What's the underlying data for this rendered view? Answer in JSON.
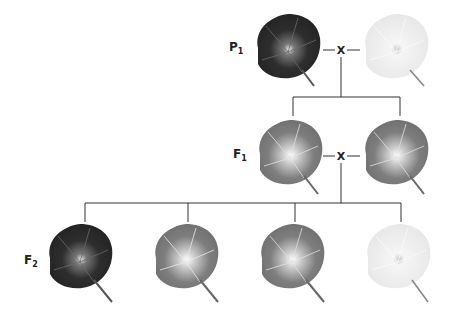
{
  "generations": [
    {
      "label": "P",
      "sub": "1",
      "cross_symbol": "X"
    },
    {
      "label": "F",
      "sub": "1",
      "cross_symbol": "X"
    },
    {
      "label": "F",
      "sub": "2"
    }
  ],
  "flowers": {
    "p1": [
      {
        "name": "purple-parent",
        "color": "#2a2a2a",
        "vein": "#6a6a6a"
      },
      {
        "name": "white-parent",
        "color": "#ececec",
        "vein": "#ffffff"
      }
    ],
    "f1": [
      {
        "name": "f1-offspring-1",
        "color": "#7a7a7a",
        "vein": "#d8d8d8"
      },
      {
        "name": "f1-offspring-2",
        "color": "#7a7a7a",
        "vein": "#d8d8d8"
      }
    ],
    "f2": [
      {
        "name": "f2-dark",
        "color": "#2a2a2a",
        "vein": "#6a6a6a"
      },
      {
        "name": "f2-medium-1",
        "color": "#8a8a8a",
        "vein": "#e0e0e0"
      },
      {
        "name": "f2-medium-2",
        "color": "#7a7a7a",
        "vein": "#d8d8d8"
      },
      {
        "name": "f2-white",
        "color": "#ececec",
        "vein": "#ffffff"
      }
    ]
  }
}
